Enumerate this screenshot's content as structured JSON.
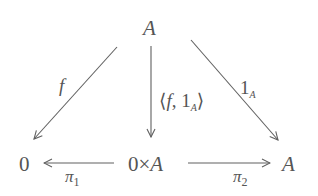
{
  "diagram": {
    "type": "commutative-diagram",
    "nodes": {
      "top": {
        "label": "A"
      },
      "bottom_left": {
        "label": "0"
      },
      "bottom_center": {
        "left": "0",
        "times": "×",
        "right": "A"
      },
      "bottom_right": {
        "label": "A"
      }
    },
    "arrows": {
      "f": {
        "from": "A",
        "to": "0",
        "label": "f"
      },
      "pair": {
        "from": "A",
        "to": "0×A",
        "open": "⟨",
        "f": "f",
        "comma": ",",
        "one": "1",
        "sub": "A",
        "close": "⟩"
      },
      "identity": {
        "from": "A",
        "to": "A",
        "one": "1",
        "sub": "A"
      },
      "pi1": {
        "from": "0×A",
        "to": "0",
        "pi": "π",
        "sub": "1"
      },
      "pi2": {
        "from": "0×A",
        "to": "A",
        "pi": "π",
        "sub": "2"
      }
    },
    "colors": {
      "stroke": "#606060",
      "text": "#555555",
      "background": "#ffffff"
    }
  }
}
